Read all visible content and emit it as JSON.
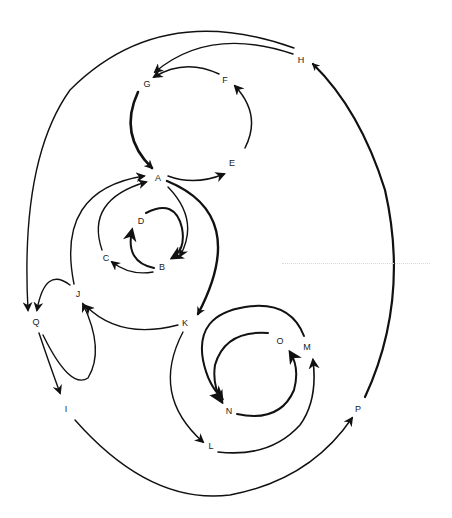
{
  "diagram": {
    "type": "directed-graph",
    "stroke_color": "#111111",
    "background": "#ffffff",
    "nodes": [
      {
        "id": "A",
        "label": "A",
        "x": 158,
        "y": 178
      },
      {
        "id": "B",
        "label": "B",
        "x": 162,
        "y": 267
      },
      {
        "id": "C",
        "label": "C",
        "x": 106,
        "y": 258
      },
      {
        "id": "D",
        "label": "D",
        "x": 141,
        "y": 221
      },
      {
        "id": "E",
        "label": "E",
        "x": 232,
        "y": 163
      },
      {
        "id": "F",
        "label": "F",
        "x": 225,
        "y": 80
      },
      {
        "id": "G",
        "label": "G",
        "x": 147,
        "y": 84
      },
      {
        "id": "H",
        "label": "H",
        "x": 301,
        "y": 60
      },
      {
        "id": "I",
        "label": "I",
        "x": 66,
        "y": 409
      },
      {
        "id": "J",
        "label": "J",
        "x": 78,
        "y": 294
      },
      {
        "id": "K",
        "label": "K",
        "x": 185,
        "y": 323
      },
      {
        "id": "L",
        "label": "L",
        "x": 211,
        "y": 446
      },
      {
        "id": "M",
        "label": "M",
        "x": 307,
        "y": 347
      },
      {
        "id": "N",
        "label": "N",
        "x": 229,
        "y": 411
      },
      {
        "id": "O",
        "label": "O",
        "x": 280,
        "y": 341
      },
      {
        "id": "P",
        "label": "P",
        "x": 358,
        "y": 409
      },
      {
        "id": "Q",
        "label": "Q",
        "x": 36,
        "y": 322
      }
    ],
    "edges": [
      {
        "from": "A",
        "to": "E",
        "weight": "thin"
      },
      {
        "from": "E",
        "to": "F",
        "weight": "thin"
      },
      {
        "from": "F",
        "to": "G",
        "weight": "thin"
      },
      {
        "from": "G",
        "to": "A",
        "weight": "thick"
      },
      {
        "from": "H",
        "to": "G",
        "weight": "thin"
      },
      {
        "from": "H",
        "to": "Q",
        "weight": "thin"
      },
      {
        "from": "A",
        "to": "B",
        "weight": "thin"
      },
      {
        "from": "A",
        "to": "K",
        "weight": "thick"
      },
      {
        "from": "D",
        "to": "B",
        "weight": "medium"
      },
      {
        "from": "B",
        "to": "D",
        "weight": "medium"
      },
      {
        "from": "B",
        "to": "C",
        "weight": "thin"
      },
      {
        "from": "C",
        "to": "A",
        "weight": "thin"
      },
      {
        "from": "J",
        "to": "A",
        "weight": "thin"
      },
      {
        "from": "J",
        "to": "Q",
        "weight": "thin"
      },
      {
        "from": "Q",
        "to": "J",
        "weight": "thin"
      },
      {
        "from": "Q",
        "to": "I",
        "weight": "thin"
      },
      {
        "from": "K",
        "to": "J",
        "weight": "thin"
      },
      {
        "from": "K",
        "to": "L",
        "weight": "thin"
      },
      {
        "from": "K",
        "to": "N",
        "weight": "medium"
      },
      {
        "from": "L",
        "to": "M",
        "weight": "thin"
      },
      {
        "from": "N",
        "to": "O",
        "weight": "medium"
      },
      {
        "from": "O",
        "to": "N",
        "weight": "medium"
      },
      {
        "from": "I",
        "to": "P",
        "weight": "thin"
      },
      {
        "from": "P",
        "to": "H",
        "weight": "thick"
      }
    ]
  }
}
